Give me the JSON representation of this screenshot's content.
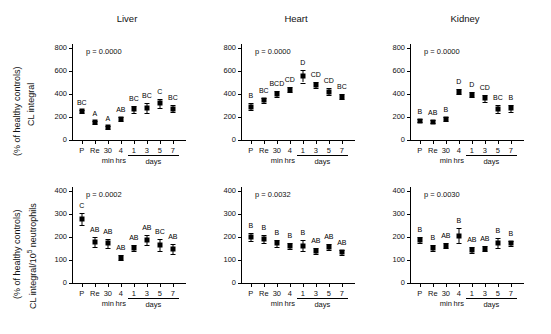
{
  "figure": {
    "panel_titles": [
      "Liver",
      "Heart",
      "Kidney"
    ],
    "x_tick_labels": [
      "P",
      "Re",
      "30",
      "4",
      "1",
      "3",
      "5",
      "7"
    ],
    "x_unit_labels": [
      "min",
      "hrs",
      "days"
    ],
    "row_axis_labels": [
      {
        "line1": "CL integral",
        "line2": "(% of healthy controls)"
      },
      {
        "line1": "CL integral/10",
        "sup": "5",
        "line1b": " neutrophils",
        "line2": "(% of healthy controls)"
      }
    ]
  },
  "chart_data": [
    {
      "type": "scatter",
      "title": "Liver",
      "row": "CL integral",
      "annotation": "p = 0.0000",
      "xlabel": "",
      "ylabel": "CL integral (% of healthy controls)",
      "ylim": [
        0,
        800
      ],
      "yticks": [
        0,
        200,
        400,
        600,
        800
      ],
      "grid": false,
      "categories": [
        "P",
        "Re",
        "30 min",
        "4 hrs",
        "1 day",
        "3 days",
        "5 days",
        "7 days"
      ],
      "values": [
        248,
        155,
        112,
        182,
        268,
        278,
        320,
        272
      ],
      "errors": [
        14,
        14,
        12,
        18,
        30,
        46,
        38,
        32
      ],
      "point_labels": [
        "BC",
        "A",
        "A",
        "AB",
        "BC",
        "BC",
        "C",
        "BC"
      ]
    },
    {
      "type": "scatter",
      "title": "Heart",
      "row": "CL integral",
      "annotation": "p = 0.0000",
      "xlabel": "",
      "ylabel": "CL integral (% of healthy controls)",
      "ylim": [
        0,
        800
      ],
      "yticks": [
        0,
        200,
        400,
        600,
        800
      ],
      "grid": false,
      "categories": [
        "P",
        "Re",
        "30 min",
        "4 hrs",
        "1 day",
        "3 days",
        "5 days",
        "7 days"
      ],
      "values": [
        290,
        345,
        398,
        436,
        555,
        480,
        420,
        378
      ],
      "errors": [
        28,
        22,
        25,
        22,
        55,
        28,
        28,
        22
      ],
      "point_labels": [
        "B",
        "BC",
        "BCD",
        "CD",
        "D",
        "CD",
        "CD",
        "BC"
      ]
    },
    {
      "type": "scatter",
      "title": "Kidney",
      "row": "CL integral",
      "annotation": "p = 0.0000",
      "xlabel": "",
      "ylabel": "CL integral (% of healthy controls)",
      "ylim": [
        0,
        800
      ],
      "yticks": [
        0,
        200,
        400,
        600,
        800
      ],
      "grid": false,
      "categories": [
        "P",
        "Re",
        "30 min",
        "4 hrs",
        "1 day",
        "3 days",
        "5 days",
        "7 days"
      ],
      "values": [
        168,
        158,
        182,
        418,
        395,
        362,
        272,
        275
      ],
      "errors": [
        14,
        14,
        14,
        22,
        25,
        32,
        35,
        28
      ],
      "point_labels": [
        "B",
        "AB",
        "B",
        "D",
        "D",
        "CD",
        "BC",
        "B"
      ]
    },
    {
      "type": "scatter",
      "title": "Liver",
      "row": "CL integral/10^5 neutrophils",
      "annotation": "p = 0.0002",
      "xlabel": "",
      "ylabel": "CL integral/10^5 neutrophils (% of healthy controls)",
      "ylim": [
        0,
        400
      ],
      "yticks": [
        0,
        100,
        200,
        300,
        400
      ],
      "grid": false,
      "categories": [
        "P",
        "Re",
        "30 min",
        "4 hrs",
        "1 day",
        "3 days",
        "5 days",
        "7 days"
      ],
      "values": [
        278,
        178,
        173,
        110,
        152,
        186,
        166,
        148
      ],
      "errors": [
        26,
        22,
        20,
        12,
        12,
        22,
        26,
        22
      ],
      "point_labels": [
        "C",
        "AB",
        "AB",
        "AB",
        "AB",
        "AB",
        "BC",
        "AB"
      ]
    },
    {
      "type": "scatter",
      "title": "Heart",
      "row": "CL integral/10^5 neutrophils",
      "annotation": "p = 0.0032",
      "xlabel": "",
      "ylabel": "CL integral/10^5 neutrophils (% of healthy controls)",
      "ylim": [
        0,
        400
      ],
      "yticks": [
        0,
        100,
        200,
        300,
        400
      ],
      "grid": false,
      "categories": [
        "P",
        "Re",
        "30 min",
        "4 hrs",
        "1 day",
        "3 days",
        "5 days",
        "7 days"
      ],
      "values": [
        200,
        192,
        172,
        160,
        163,
        138,
        157,
        133
      ],
      "errors": [
        18,
        18,
        16,
        14,
        24,
        14,
        14,
        12
      ],
      "point_labels": [
        "B",
        "B",
        "B",
        "B",
        "B",
        "AB",
        "AB",
        "AB"
      ]
    },
    {
      "type": "scatter",
      "title": "Kidney",
      "row": "CL integral/10^5 neutrophils",
      "annotation": "p = 0.0030",
      "xlabel": "",
      "ylabel": "CL integral/10^5 neutrophils (% of healthy controls)",
      "ylim": [
        0,
        400
      ],
      "yticks": [
        0,
        100,
        200,
        300,
        400
      ],
      "grid": false,
      "categories": [
        "P",
        "Re",
        "30 min",
        "4 hrs",
        "1 day",
        "3 days",
        "5 days",
        "7 days"
      ],
      "values": [
        186,
        152,
        163,
        205,
        143,
        150,
        174,
        172
      ],
      "errors": [
        14,
        12,
        12,
        32,
        12,
        10,
        20,
        12
      ],
      "point_labels": [
        "B",
        "B",
        "AB",
        "B",
        "AB",
        "AB",
        "B",
        "B"
      ]
    }
  ]
}
